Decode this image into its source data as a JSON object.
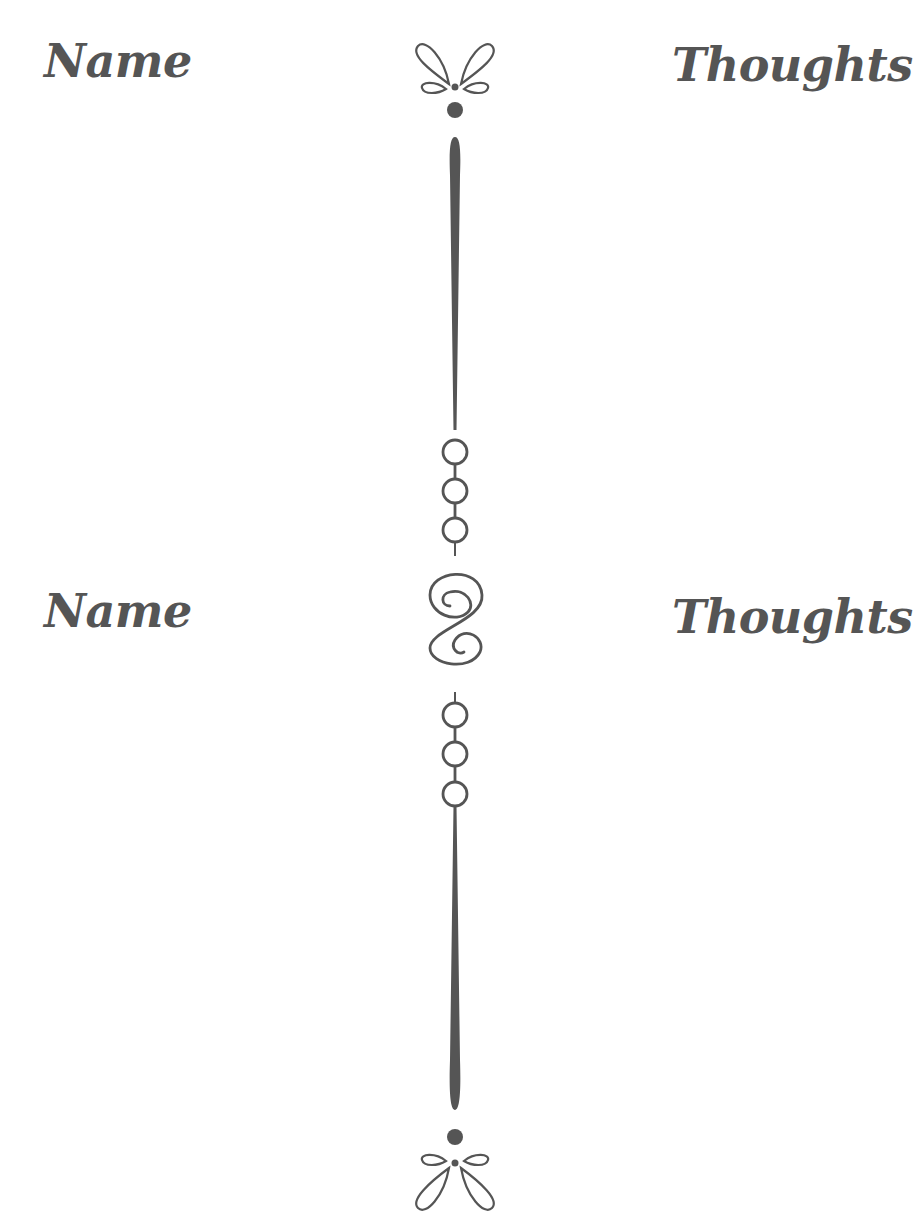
{
  "colors": {
    "ink": "#555555",
    "background": "#ffffff"
  },
  "sections": [
    {
      "left_heading": "Name",
      "right_heading": "Thoughts"
    },
    {
      "left_heading": "Name",
      "right_heading": "Thoughts"
    }
  ],
  "divider": {
    "icons": [
      "bow-flourish-icon",
      "dot-icon",
      "tapered-line",
      "three-circle-chain-icon",
      "s-swirl-icon",
      "three-circle-chain-icon",
      "tapered-line",
      "dot-icon",
      "bow-flourish-icon"
    ]
  }
}
